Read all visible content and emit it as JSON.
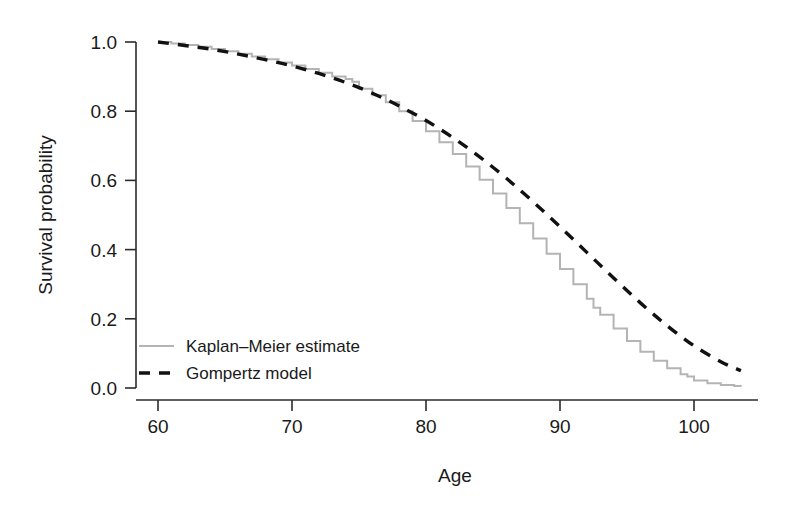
{
  "chart_data": {
    "type": "line",
    "title": "",
    "xlabel": "Age",
    "ylabel": "Survival probability",
    "xlim": [
      58,
      105
    ],
    "ylim": [
      0.0,
      1.0
    ],
    "grid": false,
    "legend_position": "inside-lower-left",
    "xticks": [
      60,
      70,
      80,
      90,
      100
    ],
    "xtick_labels": [
      "60",
      "70",
      "80",
      "90",
      "100"
    ],
    "yticks": [
      0.0,
      0.2,
      0.4,
      0.6,
      0.8,
      1.0
    ],
    "ytick_labels": [
      "0.0",
      "0.2",
      "0.4",
      "0.6",
      "0.8",
      "1.0"
    ],
    "series": [
      {
        "name": "Kaplan–Meier estimate",
        "style": "step",
        "color": "#b4b4b4",
        "x": [
          60,
          61,
          62,
          63,
          64,
          65,
          66,
          67,
          68,
          69,
          70,
          71,
          72,
          73,
          74,
          74.5,
          75,
          76,
          77,
          78,
          79,
          80,
          81,
          82,
          83,
          84,
          85,
          86,
          87,
          88,
          89,
          90,
          91,
          92,
          92.5,
          93,
          94,
          95,
          96,
          97,
          98,
          99,
          99.5,
          100,
          101,
          102,
          103,
          103.5
        ],
        "y": [
          1.0,
          0.996,
          0.991,
          0.986,
          0.98,
          0.973,
          0.966,
          0.958,
          0.95,
          0.941,
          0.932,
          0.922,
          0.911,
          0.9,
          0.893,
          0.885,
          0.865,
          0.846,
          0.826,
          0.8,
          0.772,
          0.742,
          0.71,
          0.676,
          0.64,
          0.602,
          0.562,
          0.52,
          0.476,
          0.432,
          0.388,
          0.344,
          0.3,
          0.258,
          0.232,
          0.212,
          0.172,
          0.136,
          0.105,
          0.079,
          0.057,
          0.04,
          0.033,
          0.022,
          0.014,
          0.009,
          0.006,
          0.004
        ]
      },
      {
        "name": "Gompertz model",
        "style": "dashed",
        "color": "#111111",
        "x": [
          60,
          62,
          64,
          66,
          68,
          70,
          72,
          74,
          76,
          78,
          80,
          82,
          84,
          86,
          88,
          90,
          92,
          94,
          96,
          98,
          100,
          102,
          103.5
        ],
        "y": [
          1.0,
          0.99,
          0.979,
          0.965,
          0.949,
          0.931,
          0.909,
          0.883,
          0.852,
          0.815,
          0.773,
          0.724,
          0.668,
          0.606,
          0.538,
          0.466,
          0.392,
          0.318,
          0.246,
          0.18,
          0.122,
          0.076,
          0.05
        ]
      }
    ]
  },
  "legend": {
    "items": [
      {
        "label": "Kaplan–Meier estimate",
        "style": "solid-gray"
      },
      {
        "label": "Gompertz model",
        "style": "dashed-black"
      }
    ]
  },
  "colors": {
    "kaplan_meier": "#b4b4b4",
    "gompertz": "#111111",
    "axis": "#2b2b2b",
    "background": "#ffffff"
  }
}
